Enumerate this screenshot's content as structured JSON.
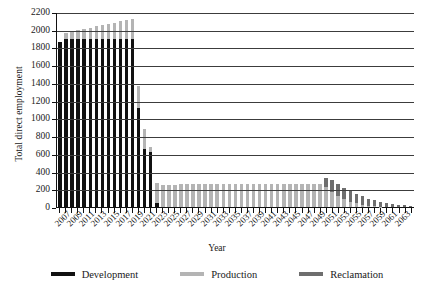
{
  "chart_data": {
    "type": "bar",
    "stacked": true,
    "title": "",
    "xlabel": "Year",
    "ylabel": "Total direct employment",
    "ylim": [
      0,
      2200
    ],
    "ytick_step": 200,
    "yticks": [
      2200,
      2000,
      1800,
      1600,
      1400,
      1200,
      1000,
      800,
      600,
      400,
      200,
      0
    ],
    "grid": "horizontal",
    "legend_position": "bottom",
    "xtick_label_step": 2,
    "x": [
      2007,
      2008,
      2009,
      2010,
      2011,
      2012,
      2013,
      2014,
      2015,
      2016,
      2017,
      2018,
      2019,
      2020,
      2021,
      2022,
      2023,
      2024,
      2025,
      2026,
      2027,
      2028,
      2029,
      2030,
      2031,
      2032,
      2033,
      2034,
      2035,
      2036,
      2037,
      2038,
      2039,
      2040,
      2041,
      2042,
      2043,
      2044,
      2045,
      2046,
      2047,
      2048,
      2049,
      2050,
      2051,
      2052,
      2053,
      2054,
      2055,
      2056,
      2057,
      2058,
      2059,
      2060,
      2061,
      2062,
      2063,
      2064,
      2065
    ],
    "xtick_labels": [
      "2007",
      "",
      "2009",
      "",
      "2011",
      "",
      "2013",
      "",
      "2015",
      "",
      "2017",
      "",
      "2019",
      "",
      "2021",
      "",
      "2023",
      "",
      "2025",
      "",
      "2027",
      "",
      "2029",
      "",
      "2031",
      "",
      "2033",
      "",
      "2035",
      "",
      "2037",
      "",
      "2039",
      "",
      "2041",
      "",
      "2043",
      "",
      "2045",
      "",
      "2047",
      "",
      "2049",
      "",
      "2051",
      "",
      "2053",
      "",
      "2055",
      "",
      "2057",
      "",
      "2059",
      "",
      "2061",
      "",
      "2063",
      "",
      ""
    ],
    "xtick_labels_shown": [
      "2007",
      "2011",
      "2015",
      "2019",
      "2023",
      "2027",
      "2031",
      "2035",
      "2039",
      "2043",
      "2047",
      "2051",
      "2055",
      "2059",
      "2063"
    ],
    "series": [
      {
        "name": "Development",
        "color": "#111111",
        "values": [
          1860,
          1900,
          1900,
          1900,
          1900,
          1900,
          1900,
          1900,
          1900,
          1900,
          1900,
          1900,
          1900,
          1120,
          660,
          620,
          40,
          0,
          0,
          0,
          0,
          0,
          0,
          0,
          0,
          0,
          0,
          0,
          0,
          0,
          0,
          0,
          0,
          0,
          0,
          0,
          0,
          0,
          0,
          0,
          0,
          0,
          0,
          0,
          0,
          0,
          0,
          0,
          0,
          0,
          0,
          0,
          0,
          0,
          0,
          0,
          0,
          0,
          0
        ]
      },
      {
        "name": "Production",
        "color": "#b4b4b4",
        "values": [
          0,
          60,
          90,
          100,
          110,
          120,
          140,
          150,
          170,
          180,
          200,
          210,
          220,
          250,
          220,
          60,
          230,
          250,
          250,
          250,
          255,
          255,
          255,
          255,
          255,
          255,
          255,
          255,
          255,
          255,
          260,
          260,
          260,
          260,
          260,
          260,
          260,
          265,
          265,
          265,
          265,
          265,
          265,
          265,
          230,
          170,
          120,
          90,
          60,
          40,
          25,
          15,
          10,
          5,
          0,
          0,
          0,
          0,
          0
        ]
      },
      {
        "name": "Reclamation",
        "color": "#6e6e6e",
        "values": [
          0,
          0,
          0,
          0,
          0,
          0,
          0,
          0,
          0,
          0,
          0,
          0,
          0,
          0,
          0,
          0,
          0,
          0,
          0,
          0,
          0,
          0,
          0,
          0,
          0,
          0,
          0,
          0,
          0,
          0,
          0,
          0,
          0,
          0,
          0,
          0,
          0,
          0,
          0,
          0,
          0,
          0,
          0,
          0,
          95,
          140,
          140,
          130,
          120,
          110,
          95,
          80,
          70,
          55,
          45,
          35,
          25,
          18,
          10
        ]
      }
    ]
  },
  "legend": {
    "items": [
      {
        "label": "Development",
        "color": "#111111"
      },
      {
        "label": "Production",
        "color": "#b4b4b4"
      },
      {
        "label": "Reclamation",
        "color": "#6e6e6e"
      }
    ]
  },
  "axes": {
    "y_title": "Total direct employment",
    "x_title": "Year"
  }
}
